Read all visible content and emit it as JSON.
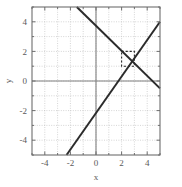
{
  "chart_data": {
    "type": "line",
    "title": "",
    "xlabel": "x",
    "ylabel": "y",
    "xlim": [
      -5,
      5
    ],
    "ylim": [
      -5,
      5
    ],
    "grid": true,
    "grid_style": "dotted",
    "grid_step": 1,
    "legend": "none",
    "xticks": [
      -4,
      -2,
      0,
      2,
      4
    ],
    "xtick_labels": [
      "-4",
      "-2",
      "0",
      "2",
      "4"
    ],
    "yticks": [
      -4,
      -2,
      0,
      2,
      4
    ],
    "ytick_labels": [
      "-4",
      "-2",
      "0",
      "2",
      "4"
    ],
    "minor_tick_step": 1,
    "axis_lines": {
      "x_axis_at_y": 0,
      "y_axis_at_x": 0,
      "color": "#808080"
    },
    "series": [
      {
        "name": "rising-line",
        "type": "line",
        "color": "#2b2b2b",
        "linewidth": 2,
        "style": "solid",
        "points": [
          [
            -2.3,
            -5
          ],
          [
            5,
            4
          ]
        ],
        "slope": 1.233,
        "intercept": -2.164
      },
      {
        "name": "falling-line",
        "type": "line",
        "color": "#2b2b2b",
        "linewidth": 2,
        "style": "solid",
        "points": [
          [
            -1.5,
            5
          ],
          [
            5,
            -0.5
          ]
        ],
        "slope": -0.846,
        "intercept": 3.731
      }
    ],
    "annotations": [
      {
        "name": "highlight-box",
        "type": "rect",
        "style": "dashed",
        "color": "#2b2b2b",
        "x0": 2,
        "y0": 1,
        "x1": 3,
        "y1": 2
      }
    ]
  },
  "axes": {
    "x_title": "x",
    "y_title": "y"
  }
}
